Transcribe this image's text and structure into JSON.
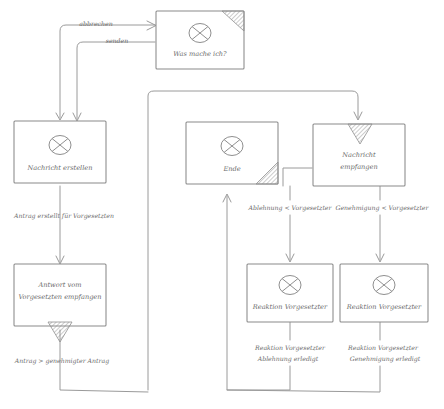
{
  "diagram": {
    "style": "hand-drawn sketch",
    "stroke_color": "#9a9a9a",
    "text_color": "#6b6b6b",
    "background": "#ffffff"
  },
  "nodes": [
    {
      "id": "was_mache_ich",
      "label": "Was mache ich?",
      "icon": "crossed-circle-icon",
      "corner_marker": "hatched-triangle-top-right"
    },
    {
      "id": "nachricht_erstellen",
      "label": "Nachricht erstellen",
      "icon": "crossed-circle-icon",
      "corner_marker": "none"
    },
    {
      "id": "ende",
      "label": "Ende",
      "icon": "crossed-circle-icon",
      "corner_marker": "hatched-triangle-bottom-right"
    },
    {
      "id": "nachricht_empfangen",
      "label_line1": "Nachricht",
      "label_line2": "empfangen",
      "icon": "none",
      "corner_marker": "hatched-triangle-top-center"
    },
    {
      "id": "antwort_vom_vorgesetzten",
      "label_line1": "Antwort vom",
      "label_line2": "Vorgesetzten empfangen",
      "icon": "none",
      "corner_marker": "hatched-triangle-bottom-center"
    },
    {
      "id": "reaktion_vorgesetzter_links",
      "label": "Reaktion Vorgesetzter",
      "icon": "crossed-circle-icon",
      "corner_marker": "none"
    },
    {
      "id": "reaktion_vorgesetzter_rechts",
      "label": "Reaktion Vorgesetzter",
      "icon": "crossed-circle-icon",
      "corner_marker": "none"
    }
  ],
  "edge_labels": {
    "abbrechen": "abbrechen",
    "senden": "senden",
    "antrag_erstellt": "Antrag erstellt für Vorgesetzten",
    "antrag_genehmigt": "Antrag > genehmigter Antrag",
    "ablehnung": "Ablehnung < Vorgesetzter",
    "genehmigung": "Genehmigung < Vorgesetzter",
    "reaktion_ablehnung_l1": "Reaktion Vorgesetzter",
    "reaktion_ablehnung_l2": "Ablehnung erledigt",
    "reaktion_genehmigung_l1": "Reaktion Vorgesetzter",
    "reaktion_genehmigung_l2": "Genehmigung erledigt"
  }
}
